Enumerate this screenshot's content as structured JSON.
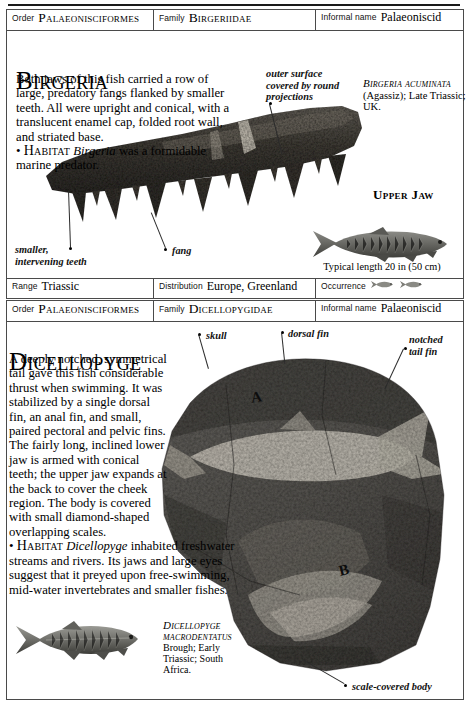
{
  "page": {
    "background": "#ffffff",
    "rule_color": "#1a1a1a"
  },
  "entries": [
    {
      "id": "birgeria",
      "header": {
        "order_label": "Order",
        "order_value": "Palaeonisciformes",
        "family_label": "Family",
        "family_value": "Birgeriidae",
        "informal_label": "Informal name",
        "informal_value": "Palaeoniscid"
      },
      "title": "Birgeria",
      "body": "Both jaws of this fish carried a row of large, predatory fangs flanked by smaller teeth. All were upright and conical, with a translucent enamel cap, folded root wall, and striated base.",
      "habitat_bullet": "•",
      "habitat_lead": "Habitat",
      "habitat_genus": "Birgeria",
      "habitat_text": " was a formidable marine predator.",
      "species_caption": {
        "name": "Birgeria acuminata",
        "detail": "(Agassiz); Late Triassic; UK."
      },
      "annotations": [
        {
          "id": "outer-surface",
          "text": "outer surface\ncovered by round\nprojections"
        },
        {
          "id": "smaller-teeth",
          "text": "smaller,\nintervening teeth"
        },
        {
          "id": "fang",
          "text": "fang"
        }
      ],
      "part_label": "Upper Jaw",
      "scale_caption": "Typical length 20 in (50 cm)",
      "footer": {
        "range_label": "Range",
        "range_value": "Triassic",
        "distribution_label": "Distribution",
        "distribution_value": "Europe, Greenland",
        "occurrence_label": "Occurrence",
        "occurrence_icons": [
          "fish-glyph",
          "fish-glyph"
        ]
      }
    },
    {
      "id": "dicellopyge",
      "header": {
        "order_label": "Order",
        "order_value": "Palaeonisciformes",
        "family_label": "Family",
        "family_value": "Dicellopygidae",
        "informal_label": "Informal name",
        "informal_value": "Palaeoniscid"
      },
      "title": "Dicellopyge",
      "body": "A deeply notched, symmetrical tail gave this fish considerable thrust when swimming. It was stabilized by a single dorsal fin, an anal fin, and small, paired pectoral and pelvic fins. The fairly long, inclined lower jaw is armed with conical teeth; the upper jaw expands at the back to cover the cheek region. The body is covered with small diamond-shaped overlapping scales.",
      "habitat_bullet": "•",
      "habitat_lead": "Habitat",
      "habitat_genus": "Dicellopyge",
      "habitat_text": " inhabited freshwater streams and rivers. Its jaws and large eyes suggest that it preyed upon free-swimming, mid-water invertebrates and smaller fishes.",
      "species_caption": {
        "name": "Dicellopyge macrodentatus",
        "detail": "Brough; Early Triassic; South Africa."
      },
      "annotations": [
        {
          "id": "skull",
          "text": "skull"
        },
        {
          "id": "dorsal-fin",
          "text": "dorsal fin"
        },
        {
          "id": "notched-tail-fin",
          "text": "notched\ntail fin"
        },
        {
          "id": "scale-covered-body",
          "text": "scale-covered body"
        }
      ],
      "slab_markers": [
        "A",
        "B"
      ],
      "scale_caption": "Typical length\n6 in (15 cm)"
    }
  ]
}
